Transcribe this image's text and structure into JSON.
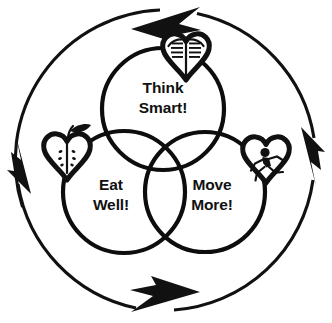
{
  "diagram": {
    "type": "three-circle-venn-with-cycle-arrows",
    "stroke_color": "#111111",
    "fill_color": "#ffffff",
    "background": "#ffffff",
    "circles": [
      {
        "id": "think-smart",
        "label_line1": "Think",
        "label_line2": "Smart!",
        "position": "top",
        "cx": 163,
        "cy": 109,
        "r": 61
      },
      {
        "id": "eat-well",
        "label_line1": "Eat",
        "label_line2": "Well!",
        "position": "bottom-left",
        "cx": 124,
        "cy": 192,
        "r": 61
      },
      {
        "id": "move-more",
        "label_line1": "Move",
        "label_line2": "More!",
        "position": "bottom-right",
        "cx": 205,
        "cy": 192,
        "r": 60
      }
    ],
    "icons": [
      {
        "id": "book-heart",
        "name": "heart-with-open-book-icon",
        "meaning": "Think Smart!",
        "position": "top",
        "cx": 186,
        "cy": 58
      },
      {
        "id": "apple-heart",
        "name": "heart-shaped-apple-icon",
        "meaning": "Eat Well!",
        "position": "left",
        "cx": 67,
        "cy": 155
      },
      {
        "id": "runner-heart",
        "name": "heart-with-running-figure-icon",
        "meaning": "Move More!",
        "position": "right",
        "cx": 266,
        "cy": 162
      }
    ],
    "cycle": {
      "direction": "clockwise",
      "cx": 166,
      "cy": 160,
      "r": 151,
      "arrow_count": 4,
      "arrows": [
        {
          "id": "arrow-top",
          "name": "cycle-arrow-top",
          "points": "right"
        },
        {
          "id": "arrow-right",
          "name": "cycle-arrow-right",
          "points": "down"
        },
        {
          "id": "arrow-bottom",
          "name": "cycle-arrow-bottom",
          "points": "left"
        },
        {
          "id": "arrow-left",
          "name": "cycle-arrow-left",
          "points": "up"
        }
      ]
    }
  }
}
